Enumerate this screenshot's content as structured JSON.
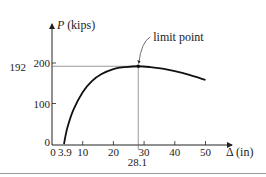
{
  "chart_data": {
    "type": "line",
    "title": "",
    "xlabel": "Δ (in)",
    "ylabel_symbol": "P",
    "ylabel_unit": "(kips)",
    "xlim": [
      0,
      55
    ],
    "ylim": [
      0,
      215
    ],
    "x_ticks": [
      0,
      10,
      20,
      30,
      40,
      50
    ],
    "x_tick_labels": [
      "0",
      "10",
      "20",
      "30",
      "40",
      "50"
    ],
    "y_ticks": [
      0,
      100,
      200
    ],
    "y_tick_labels": [
      "0",
      "100",
      "200"
    ],
    "extra_x_labels": [
      {
        "value": 3.9,
        "label": "3.9"
      },
      {
        "value": 28.1,
        "label": "28.1"
      }
    ],
    "extra_y_labels": [
      {
        "value": 192,
        "label": "192"
      }
    ],
    "grid": false,
    "series": [
      {
        "name": "load-deflection",
        "x": [
          3.9,
          5,
          7,
          10,
          13,
          16,
          20,
          24,
          28.1,
          32,
          36,
          40,
          45,
          50
        ],
        "y": [
          0,
          40,
          85,
          128,
          155,
          172,
          185,
          190,
          192,
          190,
          186,
          180,
          170,
          158
        ]
      }
    ],
    "annotations": [
      {
        "text": "limit point",
        "x": 28.1,
        "y": 192
      }
    ]
  }
}
